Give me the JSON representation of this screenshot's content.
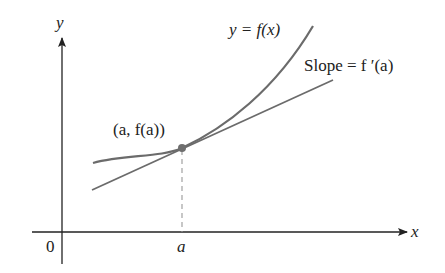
{
  "diagram": {
    "axes": {
      "x_label": "x",
      "y_label": "y",
      "origin_label": "0",
      "tick_label": "a"
    },
    "curve_label": "y = f(x)",
    "tangent_label": "Slope = f ′(a)",
    "point_label": "(a, f(a))",
    "colors": {
      "curve": "#6b6b6b",
      "tangent": "#6b6b6b",
      "point": "#6e6e6e",
      "axis": "#222222",
      "dashed": "#999999"
    }
  }
}
